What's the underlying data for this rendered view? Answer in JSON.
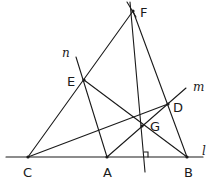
{
  "figure": {
    "points": {
      "F": "F",
      "E": "E",
      "D": "D",
      "G": "G",
      "C": "C",
      "A": "A",
      "B": "B"
    },
    "lines": {
      "l": "l",
      "m": "m",
      "n": "n"
    },
    "marks": {
      "right_angle": "right-angle"
    }
  }
}
